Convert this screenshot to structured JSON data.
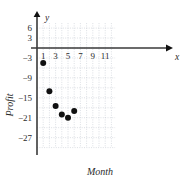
{
  "chart_data": {
    "type": "scatter",
    "title": "",
    "xlabel": "Month",
    "ylabel": "Profit",
    "x_axis_variable": "x",
    "y_axis_variable": "y",
    "xlim": [
      0,
      12.6
    ],
    "ylim": [
      -30,
      7.5
    ],
    "grid": true,
    "legend": null,
    "x_ticks": [
      1,
      3,
      5,
      7,
      9,
      11
    ],
    "x_tick_labels": [
      "1",
      "3",
      "5",
      "7",
      "9",
      "11"
    ],
    "y_ticks": [
      6,
      3,
      -3,
      -9,
      -15,
      -21,
      -27
    ],
    "y_tick_labels": [
      "6",
      "3",
      "−3",
      "−9",
      "−15",
      "−21",
      "−27"
    ],
    "x": [
      1,
      2,
      3,
      4,
      5,
      6
    ],
    "values": [
      -4.5,
      -13,
      -17.5,
      -20,
      -21,
      -19
    ],
    "points": [
      {
        "x": 1,
        "y": -4.5
      },
      {
        "x": 2,
        "y": -13
      },
      {
        "x": 3,
        "y": -17.5
      },
      {
        "x": 4,
        "y": -20
      },
      {
        "x": 5,
        "y": -21
      },
      {
        "x": 6,
        "y": -19
      }
    ],
    "marker": "filled-circle",
    "marker_color": "#111111",
    "grid_color": "#b9bfc9",
    "axis_color": "#3a3a3a",
    "background": "#ffffff"
  },
  "labels": {
    "x_ticks": [
      "1",
      "3",
      "5",
      "7",
      "9",
      "11"
    ],
    "y_ticks": [
      "6",
      "3",
      "−3",
      "−9",
      "−15",
      "−21",
      "−27"
    ],
    "x_axis_title": "Month",
    "y_axis_title": "Profit",
    "x_variable": "x",
    "y_variable": "y"
  }
}
